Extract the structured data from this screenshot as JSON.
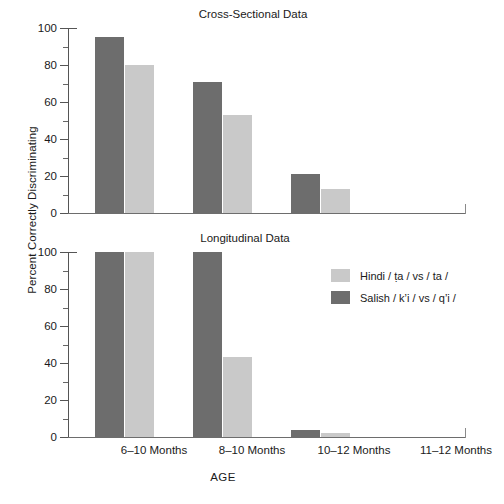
{
  "figure": {
    "ylabel": "Percent Correctly Discriminating",
    "xlabel": "AGE",
    "xtick_labels": [
      "6–10 Months",
      "8–10 Months",
      "10–12 Months",
      "11–12 Months"
    ],
    "ytick_labels": [
      "0",
      "20",
      "40",
      "60",
      "80",
      "100"
    ]
  },
  "legend": {
    "position": "right-middle",
    "entries": [
      {
        "name": "Hindi",
        "contrast": "/ ṭa / vs / ta /",
        "color": "#c9c9c9",
        "swatch": "light-gray-swatch"
      },
      {
        "name": "Salish",
        "contrast": "/ kʼi / vs / qʼi /",
        "color": "#6d6d6d",
        "swatch": "dark-gray-swatch"
      }
    ]
  },
  "chart_data": [
    {
      "type": "bar",
      "title": "Cross-Sectional Data",
      "xlabel": "AGE",
      "ylabel": "Percent Correctly Discriminating",
      "ylim": [
        0,
        100
      ],
      "yticks": [
        0,
        20,
        40,
        60,
        80,
        100
      ],
      "yticks_minor": [
        10,
        30,
        50,
        70,
        90
      ],
      "grid": false,
      "categories": [
        "6–10 Months",
        "8–10 Months",
        "10–12 Months",
        "11–12 Months"
      ],
      "series": [
        {
          "name": "Salish / kʼi / vs / qʼi /",
          "color": "#6d6d6d",
          "values": [
            95,
            71,
            21,
            null
          ]
        },
        {
          "name": "Hindi / ṭa / vs / ta /",
          "color": "#c9c9c9",
          "values": [
            80,
            53,
            13,
            null
          ]
        }
      ]
    },
    {
      "type": "bar",
      "title": "Longitudinal Data",
      "xlabel": "AGE",
      "ylabel": "Percent Correctly Discriminating",
      "ylim": [
        0,
        100
      ],
      "yticks": [
        0,
        20,
        40,
        60,
        80,
        100
      ],
      "yticks_minor": [
        10,
        30,
        50,
        70,
        90
      ],
      "grid": false,
      "categories": [
        "6–10 Months",
        "8–10 Months",
        "10–12 Months",
        "11–12 Months"
      ],
      "series": [
        {
          "name": "Salish / kʼi / vs / qʼi /",
          "color": "#6d6d6d",
          "values": [
            100,
            100,
            4,
            null
          ]
        },
        {
          "name": "Hindi / ṭa / vs / ta /",
          "color": "#c9c9c9",
          "values": [
            100,
            43,
            2,
            null
          ]
        }
      ]
    }
  ]
}
